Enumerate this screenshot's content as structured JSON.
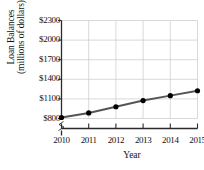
{
  "chart_data": {
    "type": "line",
    "title": "",
    "xlabel": "Year",
    "ylabel_line1": "Loan Balances",
    "ylabel_line2": "(millions of dollars)",
    "categories": [
      "2010",
      "2011",
      "2012",
      "2013",
      "2014",
      "2015"
    ],
    "x": [
      2010,
      2011,
      2012,
      2013,
      2014,
      2015
    ],
    "values": [
      815,
      885,
      980,
      1075,
      1150,
      1225
    ],
    "series": [
      {
        "name": "Loan Balances",
        "values": [
          815,
          885,
          980,
          1075,
          1150,
          1225
        ]
      }
    ],
    "ytick_labels": [
      "$800",
      "$1100",
      "$1400",
      "$1700",
      "$2000",
      "$2300"
    ],
    "ytick_values": [
      800,
      1100,
      1400,
      1700,
      2000,
      2300
    ],
    "ylim": [
      800,
      2300
    ],
    "xlim": [
      2010,
      2015
    ],
    "grid": true,
    "legend": "none",
    "axis_break": true,
    "line_color": "#555555",
    "marker_color": "#000000",
    "grid_color": "#c8c8c8",
    "axis_color": "#2b2b2b",
    "text_color": "#111111"
  }
}
